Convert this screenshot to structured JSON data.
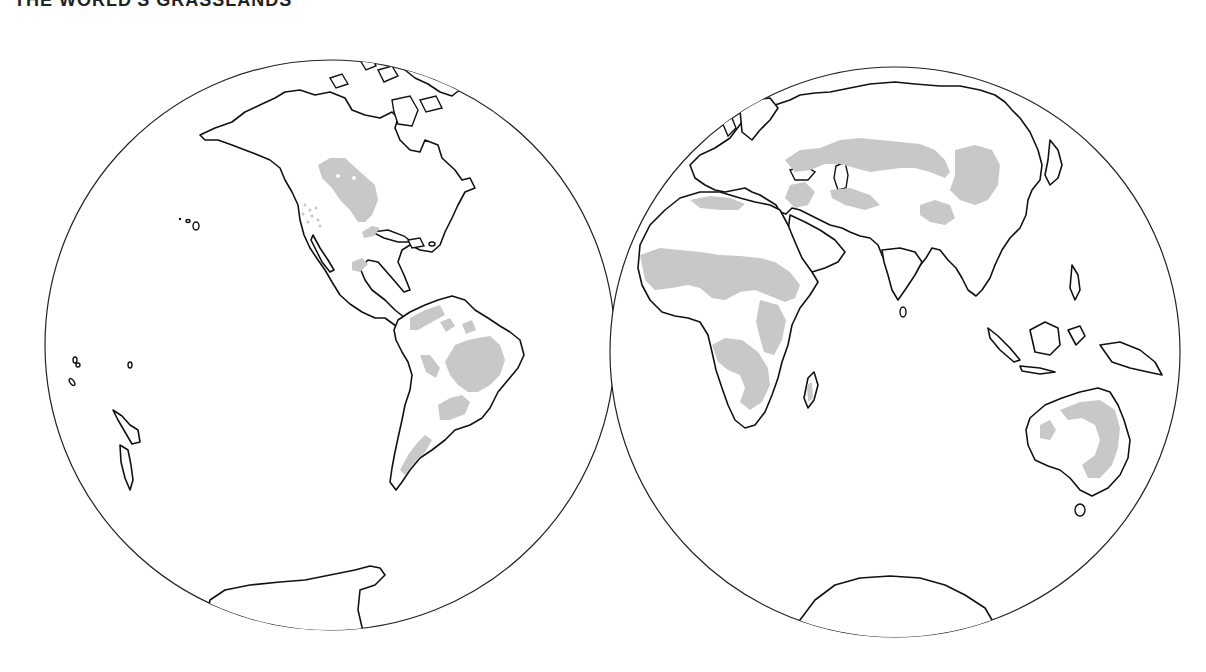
{
  "figure": {
    "number": "",
    "title": "THE WORLD'S GRASSLANDS"
  },
  "map": {
    "projection": "two-hemisphere globe",
    "colors": {
      "ocean": "#ffffff",
      "land": "#ffffff",
      "outline": "#111111",
      "grassland": "#c8c8c8"
    },
    "hemispheres": [
      {
        "name": "Western Hemisphere",
        "center": [
          330,
          345
        ],
        "radius": 285,
        "landmasses": [
          "North America",
          "Central America",
          "Caribbean",
          "South America",
          "Greenland (partial)",
          "Arctic islands",
          "Hawaii",
          "Pacific islands",
          "New Zealand",
          "Antarctica (partial)"
        ],
        "grassland_regions": [
          "Great Plains / Prairies",
          "Mexican highlands",
          "Llanos",
          "Campos / Cerrado",
          "Pampas",
          "Patagonian steppe"
        ]
      },
      {
        "name": "Eastern Hemisphere",
        "center": [
          895,
          352
        ],
        "radius": 285,
        "landmasses": [
          "Europe",
          "Asia",
          "Africa",
          "Arabian Peninsula",
          "India",
          "Southeast Asia",
          "Indonesia",
          "New Guinea",
          "Australia",
          "Madagascar",
          "Japan",
          "Sri Lanka",
          "Antarctica (partial)"
        ],
        "grassland_regions": [
          "Eurasian steppe",
          "Central Asian steppe",
          "Mongolian steppe",
          "Sahel savanna",
          "East African savanna",
          "Southern African veld",
          "Madagascar grassland",
          "Australian grassland"
        ]
      }
    ]
  }
}
